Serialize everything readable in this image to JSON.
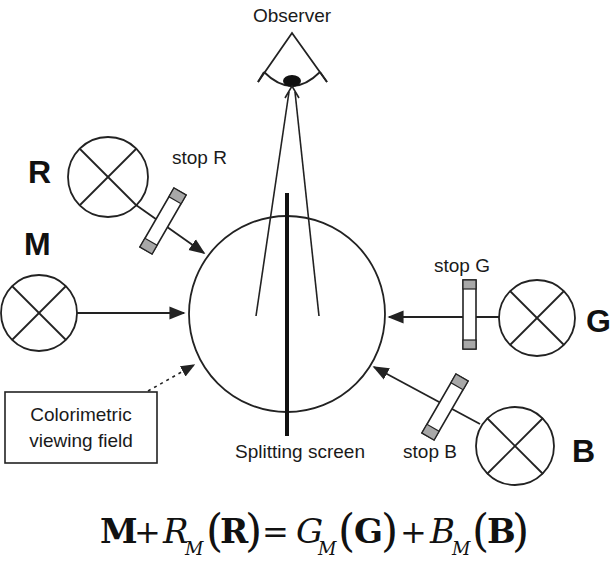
{
  "diagram": {
    "type": "colorimetric-matching-setup",
    "labels": {
      "observer": "Observer",
      "stop_r": "stop R",
      "stop_g": "stop G",
      "stop_b": "stop B",
      "splitting_screen": "Splitting screen",
      "field_line1": "Colorimetric",
      "field_line2": "viewing field"
    },
    "sources": {
      "r": "R",
      "m": "M",
      "g": "G",
      "b": "B"
    },
    "equation": {
      "m": "M",
      "plus1": "+",
      "r_coef": "R",
      "r_sub": "M",
      "r_prim": "R",
      "equals": "=",
      "g_coef": "G",
      "g_sub": "M",
      "g_prim": "G",
      "plus2": "+",
      "b_coef": "B",
      "b_sub": "M",
      "b_prim": "B",
      "lparen": "(",
      "rparen": ")"
    },
    "colors": {
      "stroke": "#222222",
      "stop_fill": "#a8a8a8",
      "background": "#ffffff"
    }
  }
}
